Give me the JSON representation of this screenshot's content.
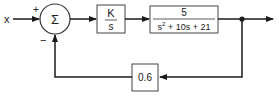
{
  "diagram": {
    "type": "block-diagram",
    "input_label": "x",
    "summing_junction": {
      "symbol": "Σ",
      "signs": {
        "top": "+",
        "bottom": "−"
      }
    },
    "blocks": [
      {
        "id": "controller",
        "numerator": "K",
        "denominator": "s"
      },
      {
        "id": "plant",
        "numerator": "5",
        "denominator_parts": [
          "s",
          "2",
          " + 10s + 21"
        ]
      },
      {
        "id": "feedback",
        "gain": "0.6"
      }
    ],
    "colors": {
      "line": "#1a1a1a",
      "box_border": "#333333",
      "background": "#ffffff"
    }
  }
}
